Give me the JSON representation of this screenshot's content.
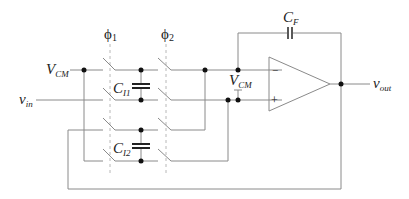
{
  "diagram": {
    "type": "switched-capacitor integrator circuit",
    "clock_phases": [
      {
        "label": "ϕ",
        "sub": "1"
      },
      {
        "label": "ϕ",
        "sub": "2"
      }
    ],
    "labels": {
      "vcm_left": {
        "main": "V",
        "sub": "CM"
      },
      "vin": {
        "main": "v",
        "sub": "in"
      },
      "ci1": {
        "main": "C",
        "sub": "I1"
      },
      "ci2": {
        "main": "C",
        "sub": "I2"
      },
      "vcm_right": {
        "main": "V",
        "sub": "CM"
      },
      "cf": {
        "main": "C",
        "sub": "F"
      },
      "vout": {
        "main": "v",
        "sub": "out"
      },
      "opamp_minus": "−",
      "opamp_plus": "+"
    },
    "colors": {
      "wire": "#8a8a8a",
      "dashed_clock_line": "#b8b8b8",
      "node": "#111111",
      "text": "#222222"
    }
  }
}
